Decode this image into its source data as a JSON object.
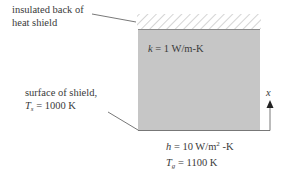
{
  "labels": {
    "back_line1": "insulated back of",
    "back_line2": "heat shield",
    "conductivity_sym": "k",
    "conductivity_val": " = 1 W/m-K",
    "surface_line1": "surface of shield,",
    "surface_temp_sym": "T",
    "surface_temp_sub": "s",
    "surface_temp_val": " = 1000 K",
    "axis_label": "x",
    "h_sym": "h",
    "h_val": " = 10 W/m",
    "h_exp": "2",
    "h_unit": " -K",
    "gas_temp_sym": "T",
    "gas_temp_sub": "g",
    "gas_temp_val": " = 1100 K"
  },
  "colors": {
    "shield_fill": "#c6c6c6",
    "hatch": "#b8b8b8",
    "line": "#555555"
  }
}
